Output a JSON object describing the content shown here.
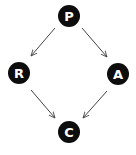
{
  "nodes": [
    {
      "id": "P",
      "label": "P",
      "x": 69,
      "y": 16
    },
    {
      "id": "R",
      "label": "R",
      "x": 19,
      "y": 73
    },
    {
      "id": "A",
      "label": "A",
      "x": 118,
      "y": 74
    },
    {
      "id": "C",
      "label": "C",
      "x": 69,
      "y": 132
    }
  ],
  "edges": [
    {
      "from": "P",
      "to": "R"
    },
    {
      "from": "P",
      "to": "A"
    },
    {
      "from": "R",
      "to": "C"
    },
    {
      "from": "A",
      "to": "C"
    }
  ],
  "colors": {
    "node_fill": "#0d0d0d",
    "node_text": "#ffffff",
    "edge": "#444444"
  }
}
